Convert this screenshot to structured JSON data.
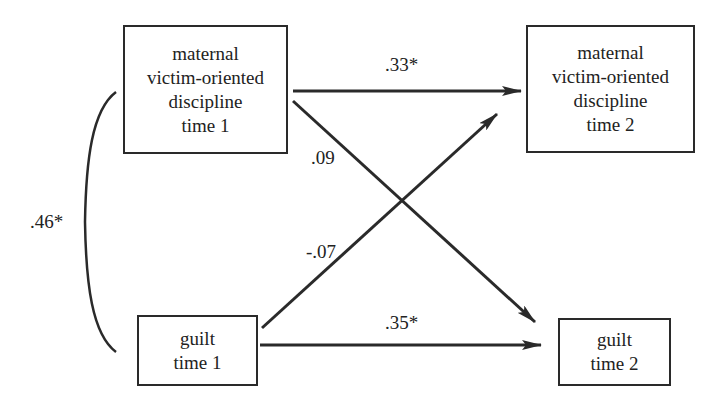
{
  "diagram": {
    "type": "cross-lagged path model",
    "nodes": {
      "maternal_t1": {
        "lines": [
          "maternal",
          "victim-oriented",
          "discipline",
          "time 1"
        ]
      },
      "maternal_t2": {
        "lines": [
          "maternal",
          "victim-oriented",
          "discipline",
          "time 2"
        ]
      },
      "guilt_t1": {
        "lines": [
          "guilt",
          "time 1"
        ]
      },
      "guilt_t2": {
        "lines": [
          "guilt",
          "time 2"
        ]
      }
    },
    "paths": {
      "maternal_stability": {
        "from": "maternal_t1",
        "to": "maternal_t2",
        "coefficient": ".33*"
      },
      "maternal_to_guilt": {
        "from": "maternal_t1",
        "to": "guilt_t2",
        "coefficient": ".09"
      },
      "guilt_to_maternal": {
        "from": "guilt_t1",
        "to": "maternal_t2",
        "coefficient": "-.07"
      },
      "guilt_stability": {
        "from": "guilt_t1",
        "to": "guilt_t2",
        "coefficient": ".35*"
      },
      "t1_correlation": {
        "between": [
          "maternal_t1",
          "guilt_t1"
        ],
        "coefficient": ".46*"
      }
    },
    "colors": {
      "stroke": "#2a2a2a",
      "background": "#ffffff"
    }
  }
}
